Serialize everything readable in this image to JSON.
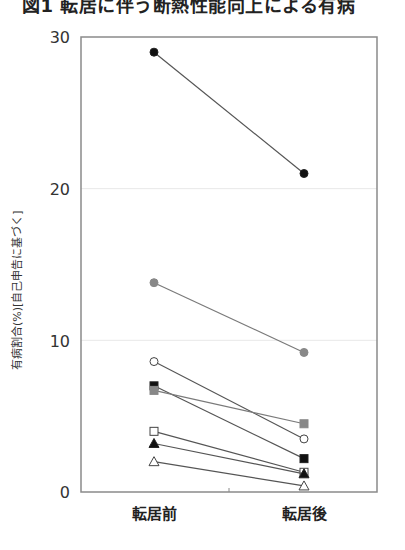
{
  "figure": {
    "title": "図1 転居に伴う断熱性能向上による有病"
  },
  "chart_data": {
    "type": "line",
    "title": "図1 転居に伴う断熱性能向上による有病",
    "xlabel": "",
    "ylabel": "有病割合(%)[自己申告に基づく]",
    "categories": [
      "転居前",
      "転居後"
    ],
    "ylim": [
      0,
      30
    ],
    "yticks": [
      0,
      10,
      20,
      30
    ],
    "grid": true,
    "legend": "none",
    "series": [
      {
        "name": "black-circle",
        "marker": "circle",
        "fill": "#111111",
        "values": [
          29.0,
          21.0
        ]
      },
      {
        "name": "gray-circle",
        "marker": "circle",
        "fill": "#888888",
        "values": [
          13.8,
          9.2
        ]
      },
      {
        "name": "open-circle",
        "marker": "circle",
        "fill": "#ffffff",
        "values": [
          8.6,
          3.5
        ]
      },
      {
        "name": "black-square",
        "marker": "square",
        "fill": "#111111",
        "values": [
          7.0,
          2.2
        ]
      },
      {
        "name": "gray-square",
        "marker": "square",
        "fill": "#888888",
        "values": [
          6.7,
          4.5
        ]
      },
      {
        "name": "open-square",
        "marker": "square",
        "fill": "#ffffff",
        "values": [
          4.0,
          1.3
        ]
      },
      {
        "name": "black-triangle",
        "marker": "triangle",
        "fill": "#111111",
        "values": [
          3.2,
          1.2
        ]
      },
      {
        "name": "open-triangle",
        "marker": "triangle",
        "fill": "#ffffff",
        "values": [
          2.0,
          0.4
        ]
      }
    ]
  },
  "axis": {
    "y_tick_labels": [
      "0",
      "10",
      "20",
      "30"
    ],
    "x_labels": [
      "転居前",
      "転居後"
    ],
    "y_title": "有病割合(%)[自己申告に基づく]"
  }
}
